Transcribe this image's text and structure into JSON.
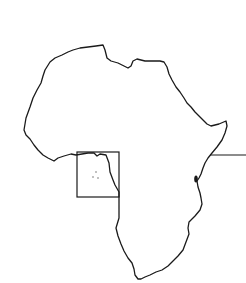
{
  "map": {
    "width": 246,
    "height": 283,
    "background": "#ffffff",
    "stroke_color": "#1a1a1a",
    "continent": {
      "name": "Africa outline",
      "path": "M24,130 L26,118 L30,107 L33,98 L37,90 L41,83 L43,76 L45,70 L50,62 L55,58 L62,55 L68,52 L73,50 L80,48 L88,47 L96,46 L103,45 L105,50 L107,58 L111,61 L118,63 L124,66 L128,68 L131,66 L133,61 L137,59 L145,61 L152,61 L160,61 L164,62 L167,67 L169,74 L172,80 L176,87 L180,92 L184,98 L187,103 L191,107 L195,112 L199,116 L203,120 L207,124 L211,126 L215,125 L219,124 L226,121 L227,126 L225,133 L222,140 L217,147 L212,153 L208,158 L205,163 L203,168 L201,174 L199,178 L197,181 L198,187 L200,193 L201,198 L202,204 L200,210 L195,216 L189,222 L188,228 L189,234 L186,242 L183,250 L178,256 L173,261 L168,266 L162,270 L156,272 L150,275 L145,277 L141,279 L138,279 L135,275 L134,269 L132,263 L128,258 L124,251 L121,244 L118,236 L116,228 L119,218 L119,210 L119,200 L119,192 L115,185 L113,180 L110,172 L109,163 L106,155 L100,154 L97,156 L94,153 L88,153 L82,154 L76,155 L71,154 L64,156 L58,158 L54,161 L48,158 L43,155 L38,150 L34,145 L30,139 L26,135 Z"
    },
    "highlight_box": {
      "label": "inset region",
      "x": 77,
      "y": 152,
      "width": 42,
      "height": 45
    },
    "leader_line": {
      "label": "pointer line",
      "x1": 210,
      "y1": 155,
      "x2": 246,
      "y2": 155
    },
    "lake_marker": {
      "label": "lake",
      "cx": 196,
      "cy": 179,
      "rx": 1.8,
      "ry": 3.5
    },
    "inset_dots": [
      {
        "cx": 96,
        "cy": 172
      },
      {
        "cx": 93,
        "cy": 177
      },
      {
        "cx": 98,
        "cy": 178
      }
    ]
  }
}
